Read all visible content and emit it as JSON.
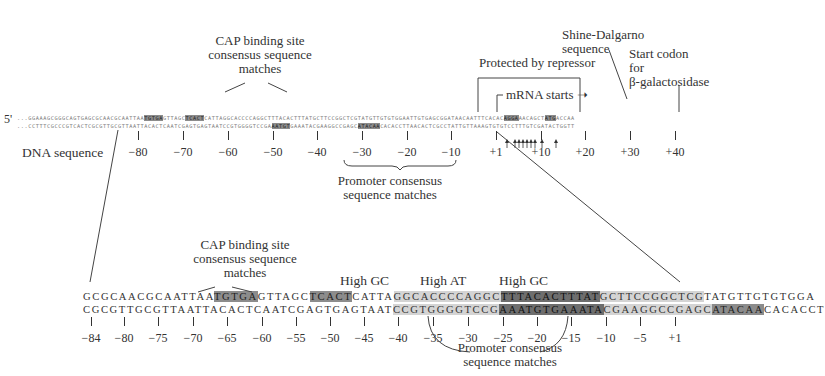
{
  "top": {
    "five_prime": "5'",
    "strand1": {
      "pre": "...GGAAAGCGGGCAGTGAGCGCAACGCAATTAA",
      "cap1": "TGTGA",
      "mid1": "GTTAGC",
      "cap2": "TCACT",
      "mid2": "CATTAGGCACCCCAGGCTTTACACTTTATGCTTCCGGCTCGTATGTTGTGTGGAATTGTGAGCGGATAACAATTTCACAC",
      "sd": "AGGA",
      "mid3": "AACAGCT",
      "start": "ATG",
      "post": "ACCAA"
    },
    "strand2": {
      "pre": "...CCTTTCGCCCGTCACTCGCGTTGCGTTAATTACACTCAATCGAGTGAGTAATCCGTGGGGTCCGA",
      "p35": "AATGT",
      "mid1": "GAAATACGAAGGCCGAGC",
      "p10": "ATACAA",
      "post": "CACACCTTAACACTCGCCTATTGTTAAAGTGTGTCCTTTGTCGATACTGGTT"
    },
    "dna_label": "DNA sequence",
    "ticks": [
      "−80",
      "−70",
      "−60",
      "−50",
      "−40",
      "−30",
      "−20",
      "−10",
      "+1",
      "+10",
      "+20",
      "+30",
      "+40"
    ],
    "cap_label": [
      "CAP binding site",
      "consensus sequence",
      "matches"
    ],
    "promoter_label": [
      "Promoter consensus",
      "sequence matches"
    ],
    "repressor_label": "Protected by repressor",
    "mrna_label": "mRNA starts",
    "sd_label": [
      "Shine-Dalgarno",
      "sequence"
    ],
    "start_label": [
      "Start codon",
      "for",
      "β-galactosidase"
    ]
  },
  "bottom": {
    "strand1": {
      "pre": "GCGCAACGCAATTAA",
      "cap1": "TGTGA",
      "mid1": "GTTAGC",
      "cap2": "TCACT",
      "mid2": "CATTA",
      "gc1": "GGCACCCCAGGC",
      "at": "TTTACACTTTAT",
      "gc2": "GCTTCCGGCTCG",
      "post": "TATGTTGTGTGGA"
    },
    "strand2": {
      "pre": "CGCGTTGCGTTAATTACACTCAATCGAGTGAGTAAT",
      "gc1": "CCGTGGGGTCCG",
      "p35": "AAATGT",
      "p35b": "GAAATA",
      "gc2": "CGAAGGCCGAGC",
      "p10": "ATACAA",
      "post": "CACACCT"
    },
    "ticks": [
      "−84",
      "−80",
      "−75",
      "−70",
      "−65",
      "−60",
      "−55",
      "−50",
      "−45",
      "−40",
      "−35",
      "−30",
      "−25",
      "−20",
      "−15",
      "−10",
      "−5",
      "+1"
    ],
    "cap_label": [
      "CAP binding site",
      "consensus sequence",
      "matches"
    ],
    "high_gc_1": "High GC",
    "high_at": "High AT",
    "high_gc_2": "High GC",
    "promoter_label": [
      "Promoter consensus",
      "sequence matches"
    ]
  }
}
